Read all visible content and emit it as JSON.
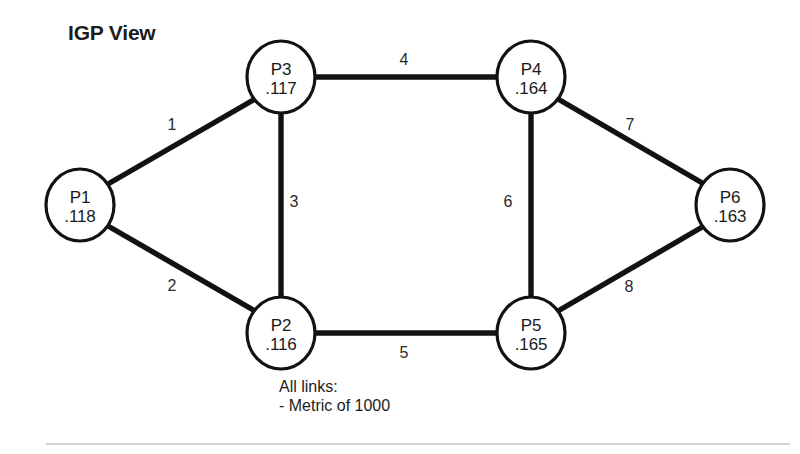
{
  "diagram": {
    "title": "IGP View",
    "caption_lines": [
      "All links:",
      "- Metric of 1000"
    ],
    "colors": {
      "line": "#121212",
      "node_fill": "#ffffff",
      "text": "#1a1a1a",
      "divider": "#d2d2d2"
    },
    "nodes": [
      {
        "id": "P1",
        "name": "P1",
        "address": ".118",
        "cx": 80,
        "cy": 205,
        "rx": 34,
        "ry": 36
      },
      {
        "id": "P2",
        "name": "P2",
        "address": ".116",
        "cx": 281,
        "cy": 333,
        "rx": 34,
        "ry": 36
      },
      {
        "id": "P3",
        "name": "P3",
        "address": ".117",
        "cx": 281,
        "cy": 77,
        "rx": 34,
        "ry": 36
      },
      {
        "id": "P4",
        "name": "P4",
        "address": ".164",
        "cx": 531,
        "cy": 77,
        "rx": 34,
        "ry": 36
      },
      {
        "id": "P5",
        "name": "P5",
        "address": ".165",
        "cx": 531,
        "cy": 333,
        "rx": 34,
        "ry": 36
      },
      {
        "id": "P6",
        "name": "P6",
        "address": ".163",
        "cx": 730,
        "cy": 205,
        "rx": 34,
        "ry": 36
      }
    ],
    "links": [
      {
        "label": "1",
        "from": "P1",
        "to": "P3",
        "x1": 108,
        "y1": 184,
        "x2": 255,
        "y2": 99,
        "lx": 172,
        "ly": 130
      },
      {
        "label": "2",
        "from": "P1",
        "to": "P2",
        "x1": 108,
        "y1": 226,
        "x2": 255,
        "y2": 311,
        "lx": 172,
        "ly": 291
      },
      {
        "label": "3",
        "from": "P3",
        "to": "P2",
        "x1": 281,
        "y1": 113,
        "x2": 281,
        "y2": 297,
        "lx": 294,
        "ly": 207
      },
      {
        "label": "4",
        "from": "P3",
        "to": "P4",
        "x1": 315,
        "y1": 77,
        "x2": 497,
        "y2": 77,
        "lx": 404,
        "ly": 65
      },
      {
        "label": "5",
        "from": "P2",
        "to": "P5",
        "x1": 315,
        "y1": 333,
        "x2": 497,
        "y2": 333,
        "lx": 404,
        "ly": 358
      },
      {
        "label": "6",
        "from": "P4",
        "to": "P5",
        "x1": 531,
        "y1": 113,
        "x2": 531,
        "y2": 297,
        "lx": 508,
        "ly": 207
      },
      {
        "label": "7",
        "from": "P4",
        "to": "P6",
        "x1": 558,
        "y1": 99,
        "x2": 704,
        "y2": 184,
        "lx": 630,
        "ly": 130
      },
      {
        "label": "8",
        "from": "P5",
        "to": "P6",
        "x1": 558,
        "y1": 311,
        "x2": 704,
        "y2": 226,
        "lx": 629,
        "ly": 292
      }
    ]
  },
  "chart_data": {
    "type": "diagram",
    "title": "IGP View",
    "subtitle": "All links: - Metric of 1000",
    "node_ids": [
      "P1",
      "P2",
      "P3",
      "P4",
      "P5",
      "P6"
    ],
    "node_addresses": [
      ".118",
      ".116",
      ".117",
      ".164",
      ".165",
      ".163"
    ],
    "edges": [
      {
        "id": "1",
        "source": "P1",
        "target": "P3",
        "metric": 1000
      },
      {
        "id": "2",
        "source": "P1",
        "target": "P2",
        "metric": 1000
      },
      {
        "id": "3",
        "source": "P3",
        "target": "P2",
        "metric": 1000
      },
      {
        "id": "4",
        "source": "P3",
        "target": "P4",
        "metric": 1000
      },
      {
        "id": "5",
        "source": "P2",
        "target": "P5",
        "metric": 1000
      },
      {
        "id": "6",
        "source": "P4",
        "target": "P5",
        "metric": 1000
      },
      {
        "id": "7",
        "source": "P4",
        "target": "P6",
        "metric": 1000
      },
      {
        "id": "8",
        "source": "P5",
        "target": "P6",
        "metric": 1000
      }
    ]
  }
}
